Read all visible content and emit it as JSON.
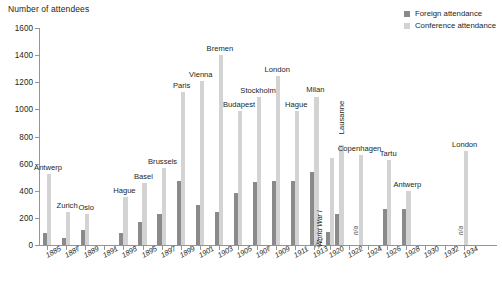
{
  "chart_data": {
    "type": "bar",
    "title": "",
    "ylabel": "Number of attendees",
    "xlabel": "",
    "ylim": [
      0,
      1600
    ],
    "ytick_step": 200,
    "yticks": [
      "0",
      "200",
      "400",
      "600",
      "800",
      "1000",
      "1200",
      "1400",
      "1600"
    ],
    "grid": false,
    "legend_position": "top-right",
    "axis_break_after": "1913",
    "annotations": [
      {
        "text": "World War I",
        "orientation": "vertical",
        "after_year": "1913"
      }
    ],
    "series": [
      {
        "name": "Foreign attendance",
        "color": "#8a8a8a"
      },
      {
        "name": "Conference attendance",
        "color": "#d3d3d3"
      }
    ],
    "categories": [
      "1885",
      "1886",
      "1887",
      "1888",
      "1889",
      "1890",
      "1891",
      "1892",
      "1893",
      "1894",
      "1895",
      "1896",
      "1897",
      "1898",
      "1899",
      "1900",
      "1901",
      "1902",
      "1903",
      "1904",
      "1905",
      "1906",
      "1907",
      "1908",
      "1909",
      "1910",
      "1911",
      "1912",
      "1913",
      "1920",
      "1921",
      "1922",
      "1923",
      "1924",
      "1925",
      "1926",
      "1927",
      "1928",
      "1929",
      "1930",
      "1931",
      "1932",
      "1933",
      "1934"
    ],
    "tick_labels": [
      "1885",
      "1887",
      "1889",
      "1891",
      "1893",
      "1895",
      "1897",
      "1899",
      "1901",
      "1903",
      "1905",
      "1907",
      "1909",
      "1911",
      "1913",
      "1920",
      "1922",
      "1924",
      "1926",
      "1928",
      "1930",
      "1932",
      "1934"
    ],
    "points": [
      {
        "year": "1885",
        "city": "Antwerp",
        "foreign": 85,
        "conference": 525,
        "label_vertical": false
      },
      {
        "year": "1887",
        "city": "Zurich",
        "foreign": 55,
        "conference": 245,
        "label_vertical": false
      },
      {
        "year": "1889",
        "city": "Oslo",
        "foreign": 110,
        "conference": 225,
        "label_vertical": false
      },
      {
        "year": "1893",
        "city": "Hague",
        "foreign": 90,
        "conference": 355,
        "label_vertical": false
      },
      {
        "year": "1895",
        "city": "Basel",
        "foreign": 170,
        "conference": 455,
        "label_vertical": false
      },
      {
        "year": "1897",
        "city": "Brussels",
        "foreign": 230,
        "conference": 570,
        "label_vertical": false
      },
      {
        "year": "1899",
        "city": "Paris",
        "foreign": 470,
        "conference": 1130,
        "label_vertical": false
      },
      {
        "year": "1901",
        "city": "Vienna",
        "foreign": 295,
        "conference": 1210,
        "label_vertical": false
      },
      {
        "year": "1903",
        "city": "Bremen",
        "foreign": 245,
        "conference": 1400,
        "label_vertical": false
      },
      {
        "year": "1905",
        "city": "Budapest",
        "foreign": 380,
        "conference": 985,
        "label_vertical": false
      },
      {
        "year": "1907",
        "city": "Stockholm",
        "foreign": 465,
        "conference": 1090,
        "label_vertical": false
      },
      {
        "year": "1909",
        "city": "London",
        "foreign": 475,
        "conference": 1245,
        "label_vertical": false
      },
      {
        "year": "1911",
        "city": "Hague",
        "foreign": 475,
        "conference": 990,
        "label_vertical": false
      },
      {
        "year": "1913",
        "city": "Milan",
        "foreign": 535,
        "conference": 1095,
        "label_vertical": false
      },
      {
        "year": "1920",
        "city": "",
        "foreign": 95,
        "conference": 640,
        "label_vertical": false
      },
      {
        "year": "1921",
        "city": "Lausanne",
        "foreign": 230,
        "conference": 740,
        "label_vertical": true
      },
      {
        "year": "1923",
        "city": "Copenhagen",
        "foreign": 0,
        "conference": 665,
        "label_vertical": false,
        "na": true
      },
      {
        "year": "1926",
        "city": "Tartu",
        "foreign": 265,
        "conference": 630,
        "label_vertical": false
      },
      {
        "year": "1928",
        "city": "Antwerp",
        "foreign": 265,
        "conference": 400,
        "label_vertical": false
      },
      {
        "year": "1934",
        "city": "London",
        "foreign": 0,
        "conference": 690,
        "label_vertical": false,
        "na": true
      }
    ]
  },
  "legend": {
    "items": [
      {
        "label": "Foreign attendance"
      },
      {
        "label": "Conference attendance"
      }
    ]
  },
  "labels": {
    "na": "n/a",
    "world_war": "World War I"
  }
}
